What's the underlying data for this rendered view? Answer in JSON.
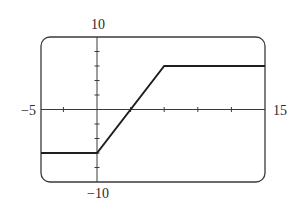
{
  "chart_data": {
    "type": "line",
    "title": "",
    "xlabel": "",
    "ylabel": "",
    "xlim": [
      -5,
      15
    ],
    "ylim": [
      -10,
      10
    ],
    "grid": false,
    "legend": null,
    "x_tick_step": 3,
    "y_tick_step": 2,
    "x_ticks": [
      -3,
      0,
      3,
      6,
      9,
      12
    ],
    "y_ticks": [
      -8,
      -6,
      -4,
      -2,
      2,
      4,
      6,
      8
    ],
    "bound_labels": {
      "xmin": "−5",
      "xmax": "15",
      "ymin": "−10",
      "ymax": "10"
    },
    "series": [
      {
        "name": "piecewise function",
        "x": [
          -5,
          0,
          6,
          15
        ],
        "y": [
          -6,
          -6,
          6,
          6
        ]
      }
    ],
    "colors": {
      "line": "#1e1e1e",
      "axes": "#3a3a3a",
      "frame": "#3a3a3a",
      "background": "#ffffff"
    }
  }
}
